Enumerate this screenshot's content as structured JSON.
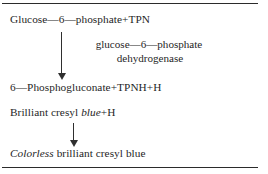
{
  "figure": {
    "kind": "reaction-scheme",
    "border_color": "#2b2b2b",
    "text_color": "#1f1f1f",
    "lines": {
      "reactant_1": "Glucose—6—phosphate+TPN",
      "enzyme_line_1": "glucose—6—phosphate",
      "enzyme_line_2": "dehydrogenase",
      "product_1": "6—Phosphogluconate+TPNH+H",
      "reactant_2_plain_before": "Brilliant cresyl ",
      "reactant_2_italic": "blue",
      "reactant_2_plain_after": "+H",
      "product_2_italic": "Colorless",
      "product_2_plain_after": " brilliant  cresyl  blue"
    },
    "arrows": {
      "arrow_1_name": "downward-arrow",
      "arrow_2_name": "downward-arrow"
    }
  }
}
